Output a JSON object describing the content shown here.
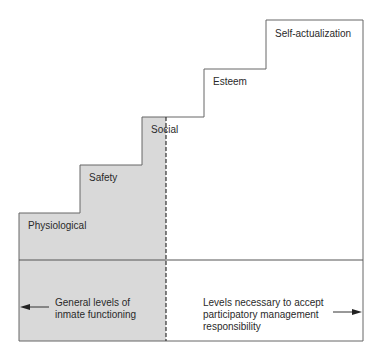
{
  "diagram": {
    "type": "staircase hierarchy",
    "steps": [
      {
        "label": "Physiological"
      },
      {
        "label": "Safety"
      },
      {
        "label": "Social"
      },
      {
        "label": "Esteem"
      },
      {
        "label": "Self-actualization"
      }
    ],
    "left_region": {
      "line1": "General levels of",
      "line2": "inmate functioning",
      "arrow": "left-arrow"
    },
    "right_region": {
      "line1": "Levels necessary to accept",
      "line2": "participatory management",
      "line3": "responsibility",
      "arrow": "right-arrow"
    },
    "colors": {
      "shaded": "#d9d9d9",
      "line": "#555555",
      "text": "#2a2a2a"
    }
  }
}
